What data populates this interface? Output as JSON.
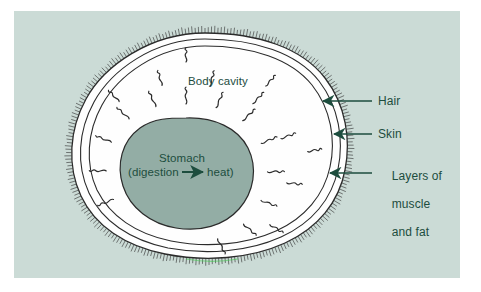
{
  "figure": {
    "kind": "anatomy-cross-section-diagram",
    "panel_background_color": "#cbdbd6",
    "page_background_color": "#ffffff",
    "body_cavity_fill_color": "#fefefe",
    "stomach_fill_color": "#93ada5",
    "outline_color": "#2b2b2b",
    "label_text_color": "#1d4d3e",
    "arrow_color": "#1d4d3e",
    "hair_color": "#3a3a3a"
  },
  "labels": {
    "body_cavity": "Body cavity",
    "stomach_title": "Stomach",
    "stomach_process_left": "(digestion",
    "stomach_process_right": "heat)",
    "hair": "Hair",
    "skin": "Skin",
    "layers_line1": "Layers of",
    "layers_line2": "muscle",
    "layers_line3": "and fat"
  },
  "callouts": [
    {
      "name": "hair",
      "label": "Hair",
      "target_layer": "hair-fringe",
      "arrow_direction": "left"
    },
    {
      "name": "skin",
      "label": "Skin",
      "target_layer": "skin-contour",
      "arrow_direction": "left"
    },
    {
      "name": "layers-of-muscle-and-fat",
      "label": "Layers of muscle and fat",
      "target_layer": "muscle-fat-contour",
      "arrow_direction": "left"
    }
  ],
  "structures": [
    {
      "name": "hair-fringe",
      "description": "Fine radial bristles along the outer body edge"
    },
    {
      "name": "skin-contour",
      "description": "Outermost solid contour line of the body"
    },
    {
      "name": "muscle-fat-contour",
      "description": "Inner contour pair enclosing muscle and fat layers"
    },
    {
      "name": "body-cavity",
      "description": "White interior region of the body"
    },
    {
      "name": "stomach",
      "description": "Sage-green blob at center where digestion produces heat"
    },
    {
      "name": "heat-squiggles",
      "description": "Wavy lines radiating outward from the stomach representing heat"
    }
  ]
}
